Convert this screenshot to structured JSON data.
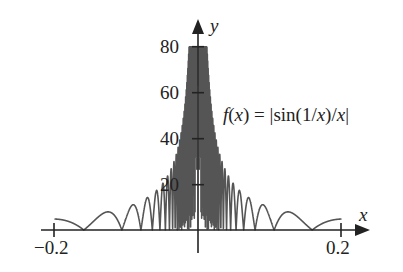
{
  "chart_data": {
    "type": "line",
    "title": "",
    "function": "f(x) = |sin(1/x)/x|",
    "annotation": "f(x) = |sin(1/x)/x|",
    "xlabel": "x",
    "ylabel": "y",
    "xlim": [
      -0.2,
      0.2
    ],
    "ylim": [
      0,
      80
    ],
    "x_ticks": [
      -0.2,
      0.2
    ],
    "x_tick_labels": [
      "−0.2",
      "0.2"
    ],
    "y_ticks": [
      20,
      40,
      60,
      80
    ],
    "y_tick_labels": [
      "20",
      "40",
      "60",
      "80"
    ],
    "grid": false,
    "legend": null,
    "clip_max": 80,
    "series": [
      {
        "name": "f(x)",
        "sample_points": [
          {
            "x": -0.2,
            "y": 4.79
          },
          {
            "x": -0.159,
            "y": 0
          },
          {
            "x": -0.13,
            "y": 7.6
          },
          {
            "x": -0.106,
            "y": 0
          },
          {
            "x": -0.0796,
            "y": 0
          },
          {
            "x": -0.05,
            "y": 18.3
          },
          {
            "x": 0.05,
            "y": 18.3
          },
          {
            "x": 0.0796,
            "y": 0
          },
          {
            "x": 0.106,
            "y": 0
          },
          {
            "x": 0.13,
            "y": 7.6
          },
          {
            "x": 0.159,
            "y": 0
          },
          {
            "x": 0.2,
            "y": 4.79
          }
        ]
      }
    ],
    "color": "#555555"
  },
  "labels": {
    "x_axis": "x",
    "y_axis": "y",
    "tick_neg": "−0.2",
    "tick_pos": "0.2",
    "y20": "20",
    "y40": "40",
    "y60": "60",
    "y80": "80"
  }
}
